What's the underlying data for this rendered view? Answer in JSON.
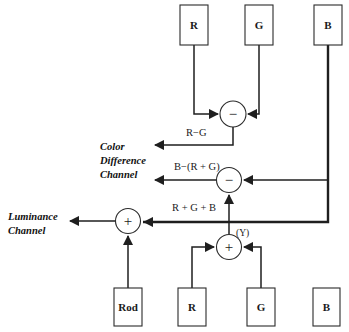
{
  "figure": {
    "type": "signal-flow-diagram",
    "background_color": "#ffffff",
    "line_color": "#1f1f1f",
    "box_fill": "#ffffff",
    "box_stroke": "#2b2b2b"
  },
  "nodes": {
    "top_boxes": [
      {
        "id": "top-r",
        "label": "R",
        "x": 180,
        "y": 5,
        "w": 28,
        "h": 40
      },
      {
        "id": "top-g",
        "label": "G",
        "x": 245,
        "y": 5,
        "w": 28,
        "h": 40
      },
      {
        "id": "top-b",
        "label": "B",
        "x": 314,
        "y": 5,
        "w": 28,
        "h": 40
      }
    ],
    "bottom_boxes": [
      {
        "id": "bottom-rod",
        "label": "Rod",
        "x": 114,
        "y": 288,
        "w": 28,
        "h": 38
      },
      {
        "id": "bottom-r",
        "label": "R",
        "x": 178,
        "y": 288,
        "w": 28,
        "h": 38
      },
      {
        "id": "bottom-g",
        "label": "G",
        "x": 247,
        "y": 288,
        "w": 28,
        "h": 38
      },
      {
        "id": "bottom-b",
        "label": "B",
        "x": 313,
        "y": 288,
        "w": 27,
        "h": 38
      }
    ],
    "operators": [
      {
        "id": "sub-rg",
        "symbol": "−",
        "cx": 233,
        "cy": 114,
        "r": 13
      },
      {
        "id": "sub-b-rg",
        "symbol": "−",
        "cx": 229,
        "cy": 180,
        "r": 12.5
      },
      {
        "id": "sum-luminance",
        "symbol": "+",
        "cx": 128,
        "cy": 221,
        "r": 12.5
      },
      {
        "id": "sum-rgb",
        "symbol": "+",
        "cx": 229,
        "cy": 247,
        "r": 12.5
      }
    ]
  },
  "labels": {
    "r_minus_g": "R−G",
    "b_minus_r_plus_g": "B−(R + G)",
    "r_plus_g_plus_b": "R + G + B",
    "y_label": "(Y)",
    "color_difference_channel": [
      "Color",
      "Difference",
      "Channel"
    ],
    "luminance_channel": [
      "Luminance",
      "Channel"
    ]
  }
}
